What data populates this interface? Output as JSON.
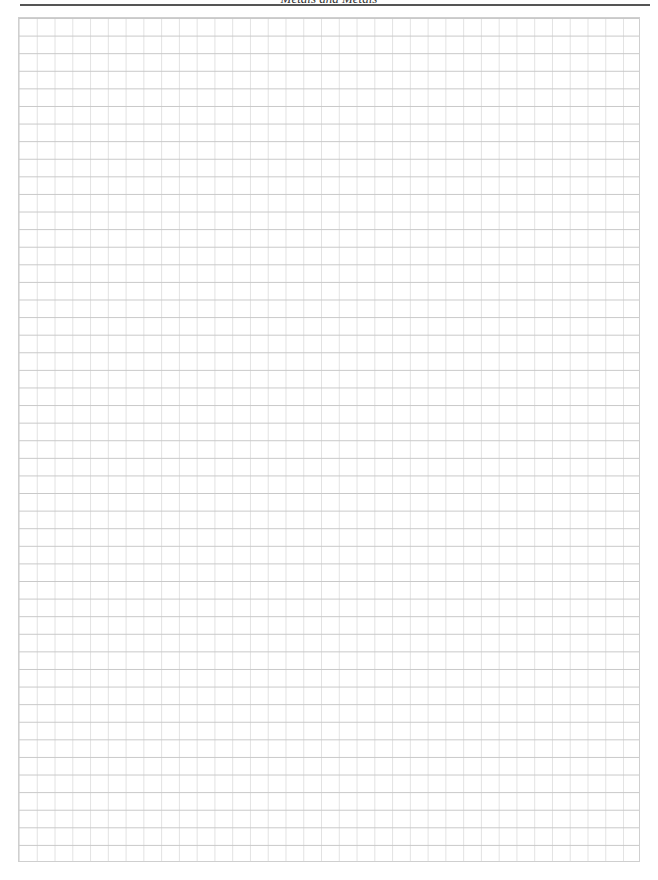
{
  "page": {
    "running_header": "Metals and Metals",
    "grid": {
      "columns": 35,
      "rows": 48,
      "line_color": "#c8c8c8"
    }
  }
}
